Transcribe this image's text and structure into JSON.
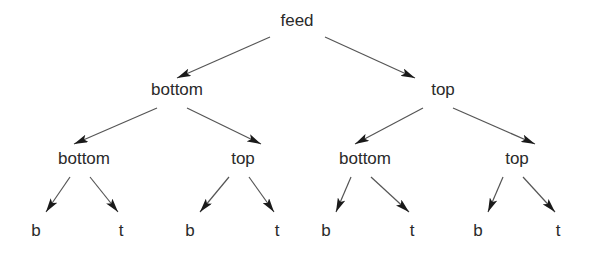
{
  "diagram": {
    "type": "binary-tree",
    "colors": {
      "text": "#2a2a2a",
      "edge": "#555555",
      "arrowhead": "#1a1a1a",
      "background": "#ffffff"
    },
    "nodes": [
      {
        "id": "root",
        "label": "feed",
        "parent": null
      },
      {
        "id": "L",
        "label": "bottom",
        "parent": "root"
      },
      {
        "id": "R",
        "label": "top",
        "parent": "root"
      },
      {
        "id": "LL",
        "label": "bottom",
        "parent": "L"
      },
      {
        "id": "LR",
        "label": "top",
        "parent": "L"
      },
      {
        "id": "RL",
        "label": "bottom",
        "parent": "R"
      },
      {
        "id": "RR",
        "label": "top",
        "parent": "R"
      },
      {
        "id": "LLL",
        "label": "b",
        "parent": "LL"
      },
      {
        "id": "LLR",
        "label": "t",
        "parent": "LL"
      },
      {
        "id": "LRL",
        "label": "b",
        "parent": "LR"
      },
      {
        "id": "LRR",
        "label": "t",
        "parent": "LR"
      },
      {
        "id": "RLL",
        "label": "b",
        "parent": "RL"
      },
      {
        "id": "RLR",
        "label": "t",
        "parent": "RL"
      },
      {
        "id": "RRL",
        "label": "b",
        "parent": "RR"
      },
      {
        "id": "RRR",
        "label": "t",
        "parent": "RR"
      }
    ]
  }
}
